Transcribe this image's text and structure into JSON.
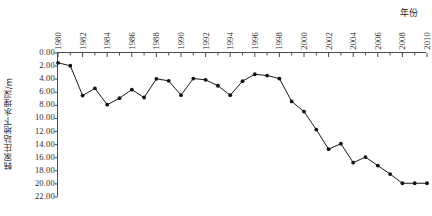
{
  "chart_data": {
    "type": "line",
    "title": "",
    "xlabel": "年份",
    "ylabel": "韩家庄站地下水埋深/m",
    "y_inverted": true,
    "ylim": [
      0.0,
      22.0
    ],
    "xlim": [
      1980,
      2010
    ],
    "grid": false,
    "legend": null,
    "y_tick_labels": [
      "0.00",
      "2.00",
      "4.00",
      "6.00",
      "8.00",
      "10.00",
      "12.00",
      "14.00",
      "16.00",
      "18.00",
      "20.00",
      "22.00"
    ],
    "y_tick_values": [
      0,
      2,
      4,
      6,
      8,
      10,
      12,
      14,
      16,
      18,
      20,
      22
    ],
    "x_tick_labels": [
      "1980",
      "1982",
      "1984",
      "1986",
      "1988",
      "1990",
      "1992",
      "1994",
      "1996",
      "1998",
      "2000",
      "2002",
      "2004",
      "2006",
      "2008",
      "2010"
    ],
    "x_tick_values": [
      1980,
      1982,
      1984,
      1986,
      1988,
      1990,
      1992,
      1994,
      1996,
      1998,
      2000,
      2002,
      2004,
      2006,
      2008,
      2010
    ],
    "x_minor_step": 1,
    "series": [
      {
        "name": "韩家庄站地下水埋深",
        "x": [
          1980,
          1981,
          1982,
          1983,
          1984,
          1985,
          1986,
          1987,
          1988,
          1989,
          1990,
          1991,
          1992,
          1993,
          1994,
          1995,
          1996,
          1997,
          1998,
          1999,
          2000,
          2001,
          2002,
          2003,
          2004,
          2005,
          2006,
          2007,
          2008,
          2009,
          2010
        ],
        "values": [
          1.5,
          1.95,
          6.5,
          5.4,
          7.9,
          6.9,
          5.6,
          6.8,
          3.95,
          4.25,
          6.45,
          3.9,
          4.1,
          5.0,
          6.45,
          4.3,
          3.25,
          3.45,
          3.9,
          7.4,
          8.95,
          11.7,
          14.7,
          13.85,
          16.75,
          15.9,
          17.2,
          18.5,
          19.9,
          19.9,
          19.9
        ]
      }
    ],
    "point_color": "#111111",
    "line_color": "#1a1a1a",
    "axis_color": "#4a4a4a"
  }
}
